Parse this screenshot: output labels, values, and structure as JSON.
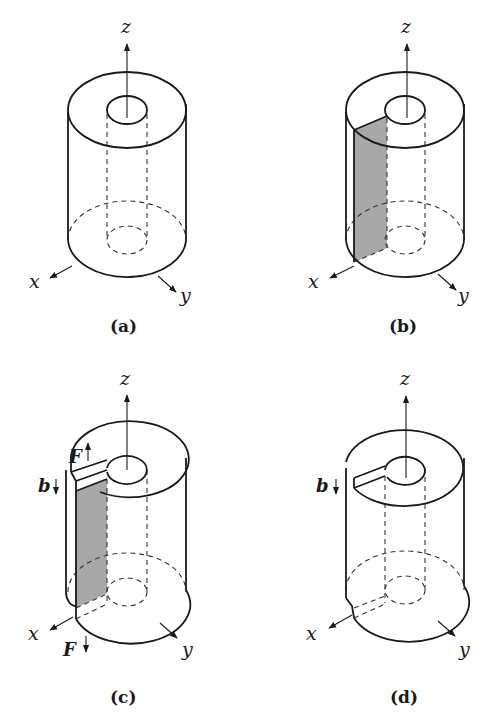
{
  "figure": {
    "panels": [
      {
        "id": "a",
        "caption": "(a)",
        "axes": {
          "x": "x",
          "y": "y",
          "z": "z"
        },
        "features": [
          "hollow cylinder",
          "dashed hidden inner bore"
        ]
      },
      {
        "id": "b",
        "caption": "(b)",
        "axes": {
          "x": "x",
          "y": "y",
          "z": "z"
        },
        "features": [
          "shaded cut plane from bore to outer surface along x"
        ]
      },
      {
        "id": "c",
        "caption": "(c)",
        "axes": {
          "x": "x",
          "y": "y",
          "z": "z"
        },
        "labels": {
          "burgers": "b",
          "force_top": "F",
          "force_bottom": "F"
        },
        "features": [
          "cut faces displaced by b",
          "opposing forces F"
        ]
      },
      {
        "id": "d",
        "caption": "(d)",
        "axes": {
          "x": "x",
          "y": "y",
          "z": "z"
        },
        "labels": {
          "burgers": "b"
        },
        "features": [
          "rejoined cylinder with step of height b"
        ]
      }
    ]
  },
  "colors": {
    "line": "#1a1a1a",
    "shade": "#a8a8a8",
    "background": "#ffffff"
  }
}
